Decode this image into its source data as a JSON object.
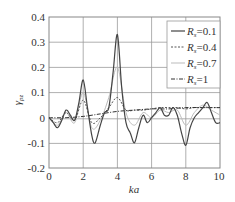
{
  "chart_data": {
    "type": "line",
    "title": "",
    "xlabel": "ka",
    "ylabel": "γ_pz",
    "xlim": [
      0,
      10
    ],
    "ylim": [
      -0.2,
      0.4
    ],
    "xticks": [
      "0",
      "2",
      "4",
      "6",
      "8",
      "10"
    ],
    "yticks": [
      "0.4",
      "0.3",
      "0.2",
      "0.1",
      "0",
      "-0.1",
      "-0.2"
    ],
    "grid": true,
    "legend_position": "upper right",
    "series": [
      {
        "name": "R_s=0.1",
        "style": "solid",
        "color": "#444444",
        "x": [
          0,
          0.25,
          0.5,
          0.75,
          1.0,
          1.25,
          1.5,
          1.75,
          2.0,
          2.25,
          2.5,
          2.7,
          3.0,
          3.25,
          3.5,
          3.75,
          4.0,
          4.25,
          4.5,
          4.75,
          5.0,
          5.25,
          5.5,
          5.75,
          6.0,
          6.25,
          6.5,
          6.75,
          7.0,
          7.25,
          7.5,
          7.75,
          8.0,
          8.25,
          8.5,
          8.75,
          9.0,
          9.25,
          9.5,
          9.75,
          10.0
        ],
        "values": [
          0,
          -0.02,
          -0.04,
          -0.01,
          0.03,
          0.01,
          -0.01,
          0.06,
          0.15,
          0.04,
          -0.07,
          -0.1,
          -0.03,
          0.02,
          0.04,
          0.18,
          0.33,
          0.12,
          -0.02,
          -0.06,
          -0.1,
          -0.04,
          0.01,
          -0.02,
          0.0,
          0.02,
          0.04,
          0.01,
          0.01,
          0.04,
          0.01,
          -0.06,
          -0.11,
          -0.04,
          0.0,
          0.02,
          0.04,
          0.06,
          0.02,
          -0.02,
          -0.02
        ]
      },
      {
        "name": "R_s=0.4",
        "style": "dashed",
        "color": "#555555",
        "x": [
          0,
          0.5,
          1.0,
          1.5,
          2.0,
          2.5,
          3.0,
          3.5,
          4.0,
          4.5,
          5.0,
          5.5,
          6.0,
          6.5,
          7.0,
          7.5,
          8.0,
          8.5,
          9.0,
          9.5,
          10.0
        ],
        "values": [
          0,
          -0.02,
          0.02,
          -0.01,
          0.07,
          -0.02,
          0.0,
          0.04,
          0.08,
          0.03,
          0.03,
          0.03,
          0.035,
          0.04,
          0.04,
          0.04,
          0.035,
          0.04,
          0.04,
          0.04,
          0.04
        ]
      },
      {
        "name": "R_s=0.7",
        "style": "solid",
        "color": "#bbbbbb",
        "x": [
          0,
          0.5,
          1.0,
          1.5,
          2.0,
          2.5,
          3.0,
          3.5,
          4.0,
          4.5,
          5.0,
          5.5,
          6.0,
          6.5,
          7.0,
          7.5,
          8.0,
          8.5,
          9.0,
          9.5,
          10.0
        ],
        "values": [
          0,
          -0.03,
          0.02,
          -0.02,
          0.1,
          -0.04,
          -0.01,
          0.08,
          0.2,
          0.02,
          -0.03,
          0.02,
          0.0,
          0.03,
          0.02,
          0.03,
          -0.03,
          0.02,
          0.05,
          0.03,
          0.01
        ]
      },
      {
        "name": "R_s=1",
        "style": "dashdot",
        "color": "#333333",
        "x": [
          0,
          1,
          2,
          3,
          4,
          5,
          6,
          7,
          8,
          9,
          10
        ],
        "values": [
          0,
          0.0,
          0.005,
          0.015,
          0.025,
          0.03,
          0.035,
          0.035,
          0.04,
          0.04,
          0.04
        ]
      }
    ]
  },
  "legend": {
    "items": [
      {
        "prefix": "R",
        "sub": "s",
        "suffix": "=0.1"
      },
      {
        "prefix": "R",
        "sub": "s",
        "suffix": "=0.4"
      },
      {
        "prefix": "R",
        "sub": "s",
        "suffix": "=0.7"
      },
      {
        "prefix": "R",
        "sub": "s",
        "suffix": "=1"
      }
    ]
  },
  "axes": {
    "xlabel": "ka",
    "ylabel_main": "γ",
    "ylabel_sub": "pz"
  }
}
